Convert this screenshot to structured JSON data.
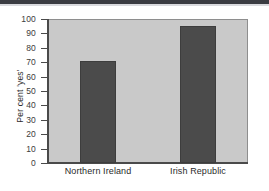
{
  "chart_data": {
    "type": "bar",
    "title": "",
    "subtitle": "",
    "xlabel": "",
    "ylabel": "Per cent 'yes'",
    "categories": [
      "Northern Ireland",
      "Irish Republic"
    ],
    "values": [
      71,
      95
    ],
    "ylim": [
      0,
      100
    ],
    "yticks": [
      0,
      10,
      20,
      30,
      40,
      50,
      60,
      70,
      80,
      90,
      100
    ],
    "ytick_labels": [
      "0",
      "10",
      "20",
      "30",
      "40",
      "50",
      "60",
      "70",
      "80",
      "90",
      "100"
    ],
    "grid": false,
    "legend": null,
    "annotations": [],
    "colors": {
      "bar_fill": "#4b4b4b",
      "bar_edge": "#3d3d3d",
      "plot_background": "#c9c9c9",
      "axis_line": "#4a4a4a",
      "page_background": "#ffffff",
      "tick_label": "#3c3c3c",
      "top_band": "#3a3c42"
    }
  }
}
